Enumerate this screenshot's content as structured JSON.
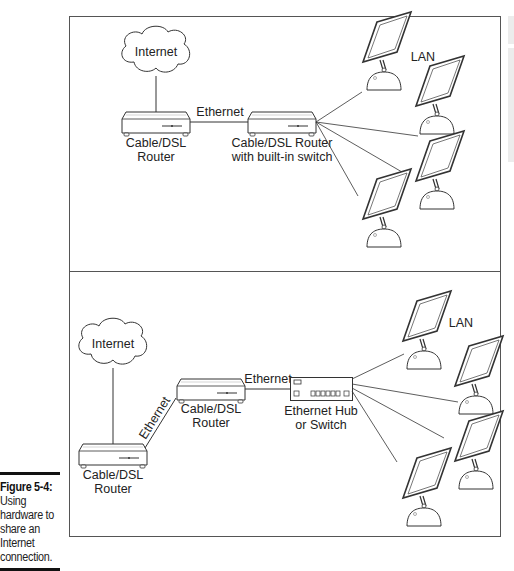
{
  "caption": {
    "figure_label": "Figure 5-4:",
    "lines": [
      "Using",
      "hardware to",
      "share an",
      "Internet",
      "connection."
    ]
  },
  "top_diagram": {
    "internet_label": "Internet",
    "router_label_line1": "Cable/DSL",
    "router_label_line2": "Router",
    "link_label": "Ethernet",
    "switch_router_line1": "Cable/DSL Router",
    "switch_router_line2": "with built-in switch",
    "lan_label": "LAN",
    "computer_count": 4
  },
  "bottom_diagram": {
    "internet_label": "Internet",
    "router1_line1": "Cable/DSL",
    "router1_line2": "Router",
    "diag_link_label": "Ethernet",
    "router2_line1": "Cable/DSL",
    "router2_line2": "Router",
    "link_label": "Ethernet",
    "hub_line1": "Ethernet Hub",
    "hub_line2": "or Switch",
    "lan_label": "LAN",
    "computer_count": 4
  },
  "colors": {
    "stroke": "#333333",
    "frame": "#555555",
    "text": "#222222",
    "side_panel": "#ececec"
  }
}
